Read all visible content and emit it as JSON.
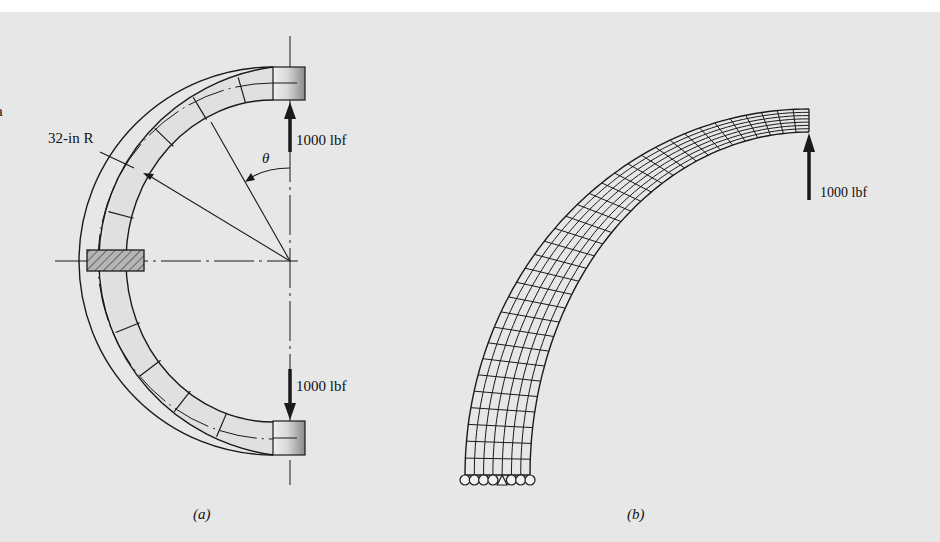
{
  "background": {
    "page": "#ffffff",
    "panel": "#e7e7e7",
    "panel_top": 12
  },
  "colors": {
    "ink": "#1a1a1a",
    "tube_fill": "#e0e0e0",
    "hatch_fill": "#b5b5b5"
  },
  "edge_fragment": {
    "text": "a",
    "x": 0,
    "y": 116
  },
  "figure_a": {
    "caption": "(a)",
    "caption_pos": [
      193,
      519
    ],
    "center": [
      290,
      261
    ],
    "outer_radius": 200,
    "inner_radius": 147,
    "mean_radius": 174,
    "radius_label": "32-in R",
    "radius_label_pos": [
      48,
      143
    ],
    "angle_label": "θ",
    "angle_label_pos": [
      262,
      163
    ],
    "tick_angles_deg": [
      16,
      31,
      46,
      75,
      112,
      127,
      142,
      157
    ],
    "loads": [
      {
        "label": "1000 lbf",
        "direction": "up",
        "label_pos": [
          296,
          145
        ]
      },
      {
        "label": "1000 lbf",
        "direction": "down",
        "label_pos": [
          296,
          391
        ]
      }
    ]
  },
  "figure_b": {
    "caption": "(b)",
    "caption_pos": [
      627,
      519
    ],
    "ellipse_center": [
      809,
      475
    ],
    "outer_radii": [
      344,
      366
    ],
    "inner_radii": [
      279,
      343
    ],
    "radial_divisions": 7,
    "arc_divisions": 34,
    "support_count": 7,
    "load": {
      "label": "1000 lbf",
      "direction": "up",
      "label_pos": [
        820,
        197
      ]
    }
  }
}
